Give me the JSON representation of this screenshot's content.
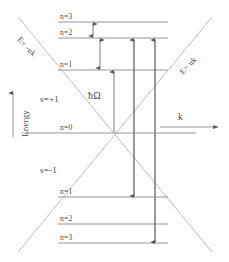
{
  "figure": {
    "type": "energy-level-diagram",
    "background_color": "#ffffff",
    "line_color": "#9a9a9a",
    "text_color": "#4a4a4a"
  },
  "axes": {
    "energy_label": "Energy",
    "momentum_label": "k"
  },
  "dispersion_branches": [
    {
      "name": "left-branch",
      "label": "E= -uk"
    },
    {
      "name": "right-branch",
      "label": "E= uk"
    }
  ],
  "spin_labels": {
    "upper": "s=+1",
    "lower": "s=-1"
  },
  "transition_label": "ħΩ",
  "upper_levels": [
    {
      "label": "n=3",
      "y": 22
    },
    {
      "label": "n=2",
      "y": 38
    },
    {
      "label": "n=1",
      "y": 70
    }
  ],
  "zero_level": {
    "label": "n=0",
    "y": 133
  },
  "lower_levels": [
    {
      "label": "n=1",
      "y": 197
    },
    {
      "label": "n=2",
      "y": 224
    },
    {
      "label": "n=3",
      "y": 243
    }
  ]
}
